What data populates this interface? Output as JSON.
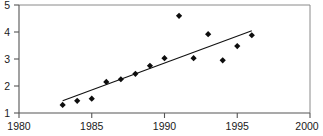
{
  "artifact": {
    "top_clipped_text": "- - - - - - - - - - - - - - -"
  },
  "chart_data": {
    "type": "scatter",
    "title": "",
    "subtitle": "",
    "xlabel": "",
    "ylabel": "",
    "xlim": [
      1980,
      2000
    ],
    "ylim": [
      1,
      5
    ],
    "grid": false,
    "legend": null,
    "xticks": [
      1980,
      1985,
      1990,
      1995,
      2000
    ],
    "xtick_labels": [
      "1980",
      "1985",
      "1990",
      "1995",
      "2000"
    ],
    "yticks": [
      1,
      2,
      3,
      4,
      5
    ],
    "ytick_labels": [
      "1",
      "2",
      "3",
      "4",
      "5"
    ],
    "marker": "filled-diamond",
    "marker_color": "#0d0d0d",
    "series": [
      {
        "name": "observations",
        "x": [
          1983,
          1984,
          1985,
          1986,
          1987,
          1988,
          1989,
          1990,
          1991,
          1992,
          1993,
          1994,
          1995,
          1996
        ],
        "y": [
          1.3,
          1.45,
          1.53,
          2.15,
          2.25,
          2.45,
          2.75,
          3.03,
          4.6,
          3.03,
          3.92,
          2.95,
          3.48,
          3.88
        ]
      }
    ],
    "trendline": {
      "type": "linear-fit",
      "color": "#111111",
      "x": [
        1983,
        1996
      ],
      "y": [
        1.45,
        4.05
      ]
    }
  }
}
